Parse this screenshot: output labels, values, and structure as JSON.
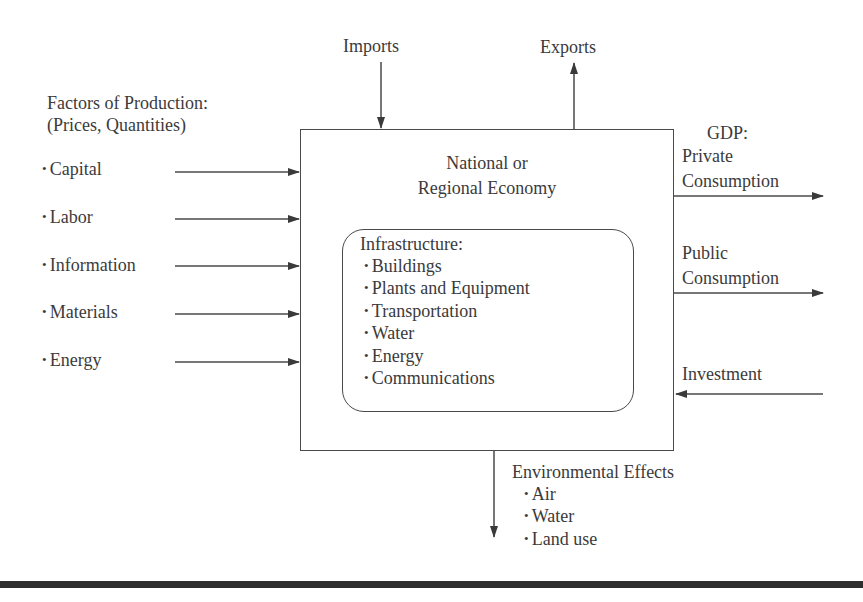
{
  "diagram": {
    "top": {
      "imports_label": "Imports",
      "exports_label": "Exports"
    },
    "factors": {
      "title_line1": "Factors of Production:",
      "title_line2": "(Prices, Quantities)",
      "items": [
        "Capital",
        "Labor",
        "Information",
        "Materials",
        "Energy"
      ]
    },
    "economy": {
      "title_line1": "National or",
      "title_line2": "Regional Economy"
    },
    "infrastructure": {
      "title": "Infrastructure:",
      "items": [
        "Buildings",
        "Plants and Equipment",
        "Transportation",
        "Water",
        "Energy",
        "Communications"
      ]
    },
    "gdp": {
      "title": "GDP:",
      "private_line1": "Private",
      "private_line2": "Consumption",
      "public_line1": "Public",
      "public_line2": "Consumption",
      "investment": "Investment"
    },
    "environment": {
      "title": "Environmental Effects",
      "items": [
        "Air",
        "Water",
        "Land use"
      ]
    },
    "colors": {
      "line": "#4a4a4a",
      "text": "#3b3b3b",
      "rule": "#2e2e2e"
    }
  }
}
